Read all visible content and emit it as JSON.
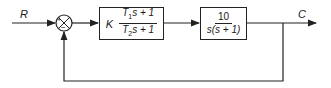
{
  "diagram": {
    "input_label": "R",
    "output_label": "C",
    "summing_junction": {
      "plus_sign": "+",
      "minus_sign": "−"
    },
    "controller": {
      "gain": "K",
      "numerator": {
        "coef": "T",
        "sub": "1",
        "rest": "s + 1"
      },
      "denominator": {
        "coef": "T",
        "sub": "2",
        "rest": "s + 1"
      }
    },
    "plant": {
      "numerator": "10",
      "denominator": "s(s + 1)"
    },
    "feedback": "unity negative feedback",
    "colors": {
      "line": "#222222",
      "background": "#ffffff"
    }
  }
}
